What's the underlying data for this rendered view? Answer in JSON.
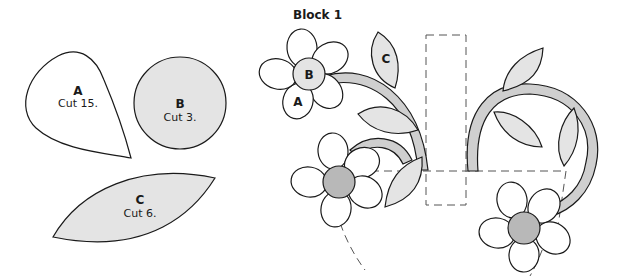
{
  "title": "Block 1",
  "colors": {
    "light_fill": "#e4e4e4",
    "dark_fill": "#b8b8b8",
    "stem_fill": "#cfcfcf",
    "outline": "#1a1a1a",
    "dashed": "#555555"
  },
  "templates": [
    {
      "letter": "A",
      "instruction": "Cut 15.",
      "shape": "teardrop-petal"
    },
    {
      "letter": "B",
      "instruction": "Cut 3.",
      "shape": "circle-center"
    },
    {
      "letter": "C",
      "instruction": "Cut 6.",
      "shape": "leaf"
    }
  ],
  "block_labels": {
    "petal": "A",
    "center": "B",
    "leaf": "C"
  }
}
